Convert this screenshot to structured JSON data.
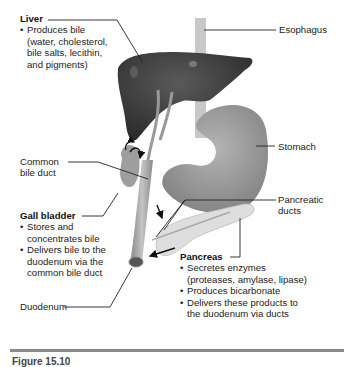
{
  "diagram": {
    "type": "anatomy",
    "labels": {
      "liver": {
        "title": "Liver",
        "bullets": [
          "Produces bile",
          "(water, cholesterol,",
          "bile salts, lecithin,",
          "and pigments)"
        ]
      },
      "esophagus": {
        "title": "Esophagus"
      },
      "stomach": {
        "title": "Stomach"
      },
      "common_bile_duct": {
        "line1": "Common",
        "line2": "bile duct"
      },
      "gall_bladder": {
        "title": "Gall bladder",
        "bullets": [
          "Stores and",
          "concentrates bile",
          "Delivers bile to the",
          "duodenum via the",
          "common bile duct"
        ]
      },
      "pancreatic_ducts": {
        "line1": "Pancreatic",
        "line2": "ducts"
      },
      "pancreas": {
        "title": "Pancreas",
        "bullets": [
          "Secretes enzymes",
          "(proteases, amylase, lipase)",
          "Produces bicarbonate",
          "Delivers these products to",
          "the duodenum via ducts"
        ]
      },
      "duodenum": {
        "title": "Duodenum"
      }
    },
    "caption": "Figure 15.10"
  },
  "colors": {
    "liver": "#3a3a3a",
    "stomach": "#9a9a9a",
    "duct": "#a6a6a6",
    "pancreas": "#dcdcdc",
    "leader_line": "#222222",
    "rule": "#8a8a8a"
  }
}
